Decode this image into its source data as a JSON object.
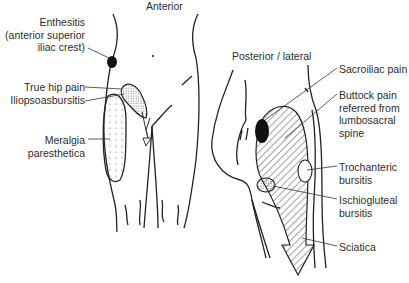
{
  "views": {
    "anterior": {
      "title": "Anterior",
      "labels": [
        {
          "id": "enthesitis",
          "text": "Enthesitis\n(anterior superior\niliac crest)"
        },
        {
          "id": "true-hip-pain",
          "text": "True hip pain"
        },
        {
          "id": "iliopsoas",
          "text": "Iliopsoasbursitis"
        },
        {
          "id": "meralgia",
          "text": "Meralgia\nparesthetica"
        }
      ]
    },
    "posterior": {
      "title": "Posterior / lateral",
      "labels": [
        {
          "id": "sacroiliac",
          "text": "Sacroiliac pain"
        },
        {
          "id": "buttock",
          "text": "Buttock pain\nreferred from\nlumbosacral\nspine"
        },
        {
          "id": "trochanteric",
          "text": "Trochanteric\nbursitis"
        },
        {
          "id": "ischiogluteal",
          "text": "Ischiogluteal\nbursitis"
        },
        {
          "id": "sciatica",
          "text": "Sciatica"
        }
      ]
    }
  },
  "colors": {
    "line": "#222222",
    "fill_dark": "#111111",
    "stipple": "#555555"
  }
}
